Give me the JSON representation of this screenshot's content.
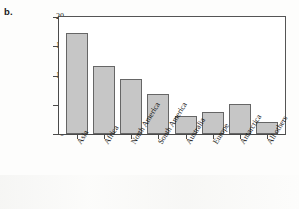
{
  "panel": {
    "label": "b."
  },
  "chart_data": {
    "type": "bar",
    "title": "",
    "xlabel": "",
    "ylabel": "Area (millions of sq. miles)",
    "categories": [
      "Asia",
      "Africa",
      "North America",
      "South America",
      "Australia",
      "Europe",
      "Antarctica",
      "All others"
    ],
    "values": [
      17.3,
      11.7,
      9.4,
      6.9,
      3.0,
      3.8,
      5.1,
      2.1
    ],
    "ylim": [
      0,
      20
    ],
    "yticks": [
      0,
      5,
      10,
      15,
      20
    ],
    "ytick_labels": [
      "0",
      "5",
      "10",
      "15",
      "20"
    ],
    "grid": false,
    "legend": null,
    "bar_color": "#c6c6c6",
    "bar_border_color": "#666666",
    "axis_color": "#4a4a4a"
  }
}
